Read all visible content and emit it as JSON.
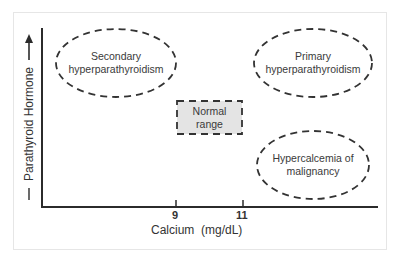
{
  "diagram": {
    "x_axis": {
      "label": "Calcium  (mg/dL)",
      "ticks": [
        {
          "label": "9"
        },
        {
          "label": "11"
        }
      ]
    },
    "y_axis": {
      "label": "Parathyroid Hormone",
      "arrow": "up-arrow"
    },
    "regions": [
      {
        "id": "secondary",
        "line1": "Secondary",
        "line2": "hyperparathyroidism",
        "shape": "dashed-ellipse"
      },
      {
        "id": "primary",
        "line1": "Primary",
        "line2": "hyperparathyroidism",
        "shape": "dashed-ellipse"
      },
      {
        "id": "normal",
        "line1": "Normal",
        "line2": "range",
        "shape": "dashed-rectangle"
      },
      {
        "id": "malignancy",
        "line1": "Hypercalcemia of",
        "line2": "malignancy",
        "shape": "dashed-ellipse"
      }
    ],
    "colors": {
      "axis": "#2b2b2b",
      "dash": "#333333",
      "normal_fill": "#e4e4e4",
      "frame": "#e6e6e6"
    }
  }
}
